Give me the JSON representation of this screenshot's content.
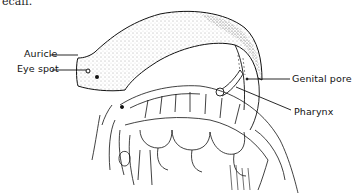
{
  "figure": {
    "cut_off_text": "ecaff.",
    "labels": [
      {
        "id": "auricle",
        "text": "Auricle"
      },
      {
        "id": "eye_spot",
        "text": "Eye spot"
      },
      {
        "id": "genital_pore",
        "text": "Genital pore"
      },
      {
        "id": "pharynx",
        "text": "Pharynx"
      }
    ],
    "colors": {
      "ink": "#111111",
      "background": "#ffffff",
      "stipple": "#555555"
    }
  }
}
